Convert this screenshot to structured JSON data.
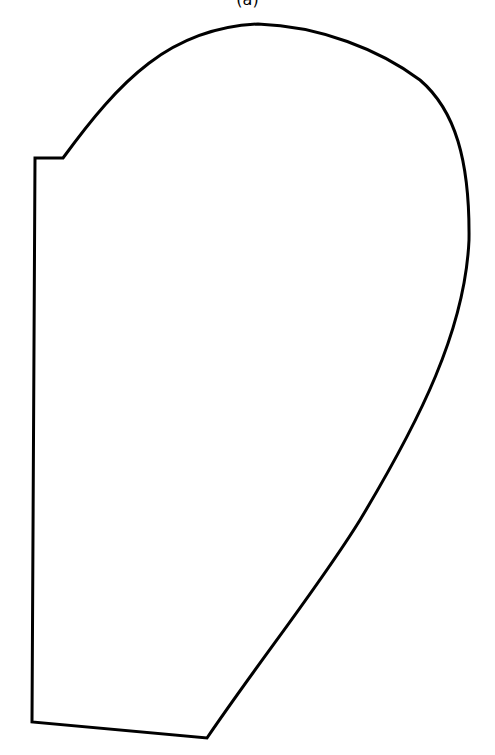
{
  "figure": {
    "caption": "(a)",
    "stroke_color": "#000000",
    "fill_color": "#ffffff",
    "stroke_width": 3,
    "shape": {
      "label": "closed outline shape",
      "path": "M 35 158 L 63 158 C 120 80, 170 28, 258 24 C 320 26, 380 50, 420 80 C 455 110, 470 160, 469 240 C 465 330, 420 420, 360 520 C 320 585, 260 660, 207 738 L 32 722 L 35 158 Z"
    }
  }
}
